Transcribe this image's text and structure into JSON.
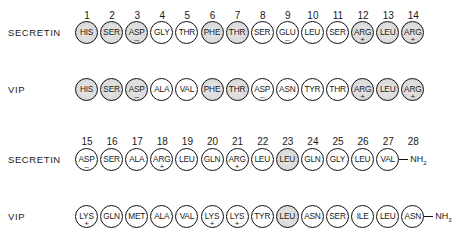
{
  "diagram": {
    "shading_meaning": "shaded circles indicate residues identical in both peptides",
    "colors": {
      "outline": "#111111",
      "shaded_fill": "#d8d8d8",
      "unshaded_fill": "#ffffff"
    },
    "blocks": [
      {
        "positions": [
          "1",
          "2",
          "3",
          "4",
          "5",
          "6",
          "7",
          "8",
          "9",
          "10",
          "11",
          "12",
          "13",
          "14"
        ],
        "rows": [
          {
            "label": "SECRETIN",
            "residues": [
              {
                "code": "HIS",
                "charge": "",
                "shaded": true
              },
              {
                "code": "SER",
                "charge": "",
                "shaded": true
              },
              {
                "code": "ASP",
                "charge": "–",
                "shaded": true
              },
              {
                "code": "GLY",
                "charge": "",
                "shaded": false
              },
              {
                "code": "THR",
                "charge": "",
                "shaded": false
              },
              {
                "code": "PHE",
                "charge": "",
                "shaded": true
              },
              {
                "code": "THR",
                "charge": "",
                "shaded": true
              },
              {
                "code": "SER",
                "charge": "",
                "shaded": false
              },
              {
                "code": "GLU",
                "charge": "–",
                "shaded": false
              },
              {
                "code": "LEU",
                "charge": "",
                "shaded": false
              },
              {
                "code": "SER",
                "charge": "",
                "shaded": false
              },
              {
                "code": "ARG",
                "charge": "+",
                "shaded": true
              },
              {
                "code": "LEU",
                "charge": "",
                "shaded": true
              },
              {
                "code": "ARG",
                "charge": "+",
                "shaded": true
              }
            ],
            "terminus": ""
          },
          {
            "label": "VIP",
            "residues": [
              {
                "code": "HIS",
                "charge": "",
                "shaded": true
              },
              {
                "code": "SER",
                "charge": "",
                "shaded": true
              },
              {
                "code": "ASP",
                "charge": "–",
                "shaded": true
              },
              {
                "code": "ALA",
                "charge": "",
                "shaded": false
              },
              {
                "code": "VAL",
                "charge": "",
                "shaded": false
              },
              {
                "code": "PHE",
                "charge": "",
                "shaded": true
              },
              {
                "code": "THR",
                "charge": "",
                "shaded": true
              },
              {
                "code": "ASP",
                "charge": "–",
                "shaded": false
              },
              {
                "code": "ASN",
                "charge": "",
                "shaded": false
              },
              {
                "code": "TYR",
                "charge": "",
                "shaded": false
              },
              {
                "code": "THR",
                "charge": "",
                "shaded": false
              },
              {
                "code": "ARG",
                "charge": "+",
                "shaded": true
              },
              {
                "code": "LEU",
                "charge": "",
                "shaded": true
              },
              {
                "code": "ARG",
                "charge": "+",
                "shaded": true
              }
            ],
            "terminus": ""
          }
        ]
      },
      {
        "positions": [
          "15",
          "16",
          "17",
          "18",
          "19",
          "20",
          "21",
          "22",
          "23",
          "24",
          "25",
          "26",
          "27",
          "28"
        ],
        "rows": [
          {
            "label": "SECRETIN",
            "residues": [
              {
                "code": "ASP",
                "charge": "–",
                "shaded": false
              },
              {
                "code": "SER",
                "charge": "",
                "shaded": false
              },
              {
                "code": "ALA",
                "charge": "",
                "shaded": false
              },
              {
                "code": "ARG",
                "charge": "+",
                "shaded": false
              },
              {
                "code": "LEU",
                "charge": "",
                "shaded": false
              },
              {
                "code": "GLN",
                "charge": "",
                "shaded": false
              },
              {
                "code": "ARG",
                "charge": "+",
                "shaded": false
              },
              {
                "code": "LEU",
                "charge": "",
                "shaded": false
              },
              {
                "code": "LEU",
                "charge": "",
                "shaded": true
              },
              {
                "code": "GLN",
                "charge": "",
                "shaded": false
              },
              {
                "code": "GLY",
                "charge": "",
                "shaded": false
              },
              {
                "code": "LEU",
                "charge": "",
                "shaded": false
              },
              {
                "code": "VAL",
                "charge": "",
                "shaded": false
              }
            ],
            "terminus": "NH",
            "terminus_sub": "2"
          },
          {
            "label": "VIP",
            "residues": [
              {
                "code": "LYS",
                "charge": "+",
                "shaded": false
              },
              {
                "code": "GLN",
                "charge": "",
                "shaded": false
              },
              {
                "code": "MET",
                "charge": "",
                "shaded": false
              },
              {
                "code": "ALA",
                "charge": "",
                "shaded": false
              },
              {
                "code": "VAL",
                "charge": "",
                "shaded": false
              },
              {
                "code": "LYS",
                "charge": "+",
                "shaded": false
              },
              {
                "code": "LYS",
                "charge": "+",
                "shaded": false
              },
              {
                "code": "TYR",
                "charge": "",
                "shaded": false
              },
              {
                "code": "LEU",
                "charge": "",
                "shaded": true
              },
              {
                "code": "ASN",
                "charge": "",
                "shaded": false
              },
              {
                "code": "SER",
                "charge": "",
                "shaded": false
              },
              {
                "code": "ILE",
                "charge": "",
                "shaded": false
              },
              {
                "code": "LEU",
                "charge": "",
                "shaded": false
              },
              {
                "code": "ASN",
                "charge": "",
                "shaded": false
              }
            ],
            "terminus": "NH",
            "terminus_sub": "3"
          }
        ]
      }
    ]
  }
}
